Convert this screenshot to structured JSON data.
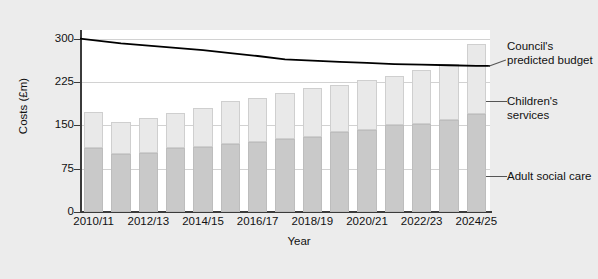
{
  "chart_data": {
    "type": "bar",
    "subtype": "stacked-bar-with-line",
    "title": "",
    "xlabel": "Year",
    "ylabel": "Costs (£m)",
    "ylim": [
      0,
      315
    ],
    "yticks": [
      0,
      75,
      150,
      225,
      300
    ],
    "ytick_labels": [
      "0",
      "75",
      "150",
      "225",
      "300"
    ],
    "grid": true,
    "grid_axis": "y",
    "legend_position": "right-annotations",
    "categories": [
      "2010/11",
      "2011/12",
      "2012/13",
      "2013/14",
      "2014/15",
      "2015/16",
      "2016/17",
      "2017/18",
      "2018/19",
      "2019/20",
      "2020/21",
      "2021/22",
      "2022/23",
      "2023/24",
      "2024/25"
    ],
    "xtick_labels": [
      "2010/11",
      "2012/13",
      "2014/15",
      "2016/17",
      "2018/19",
      "2020/21",
      "2022/23",
      "2024/25"
    ],
    "xtick_indices": [
      0,
      2,
      4,
      6,
      8,
      10,
      12,
      14
    ],
    "series": [
      {
        "name": "Adult social care",
        "color": "#c9c9c9",
        "type": "bar-segment",
        "values": [
          110,
          100,
          102,
          110,
          112,
          118,
          122,
          126,
          130,
          138,
          142,
          150,
          152,
          160,
          170
        ]
      },
      {
        "name": "Children's services",
        "color": "#e9e9e9",
        "type": "bar-segment",
        "values": [
          63,
          55,
          60,
          62,
          68,
          74,
          76,
          80,
          84,
          82,
          86,
          86,
          94,
          96,
          120
        ]
      },
      {
        "name": "Council's predicted budget",
        "color": "#000000",
        "type": "line",
        "values": [
          300,
          292,
          288,
          284,
          280,
          275,
          270,
          264,
          262,
          260,
          258,
          256,
          255,
          254,
          253
        ]
      }
    ],
    "totals": [
      173,
      155,
      162,
      172,
      180,
      192,
      198,
      206,
      214,
      220,
      228,
      236,
      246,
      256,
      290
    ],
    "annotations": [
      {
        "text": "Council's predicted budget",
        "target": "line"
      },
      {
        "text": "Children's services",
        "target": "upper-bar-segment"
      },
      {
        "text": "Adult social care",
        "target": "lower-bar-segment"
      }
    ]
  },
  "annotations": {
    "budget": "Council's predicted budget",
    "children": "Children's services",
    "adult": "Adult social care"
  }
}
